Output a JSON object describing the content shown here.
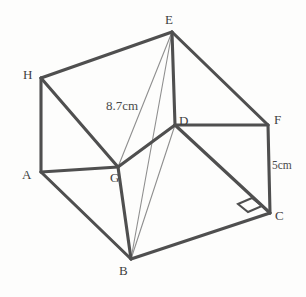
{
  "figure": {
    "type": "geometry-diagram",
    "shape": "cuboid",
    "background_color": "#fdfdfc",
    "edge_color": "#4f4f4f",
    "diagonal_color": "#8a8a8a",
    "label_color": "#3f3f3f",
    "width": 306,
    "height": 297
  },
  "vertices": [
    {
      "id": "E",
      "label": "E",
      "x": 172,
      "y": 32,
      "label_x": 165,
      "label_y": 13
    },
    {
      "id": "H",
      "label": "H",
      "x": 41,
      "y": 78,
      "label_x": 23,
      "label_y": 68
    },
    {
      "id": "F",
      "label": "F",
      "x": 268,
      "y": 125,
      "label_x": 274,
      "label_y": 113
    },
    {
      "id": "D",
      "label": "D",
      "x": 175,
      "y": 125,
      "label_x": 179,
      "label_y": 114
    },
    {
      "id": "A",
      "label": "A",
      "x": 41,
      "y": 172,
      "label_x": 22,
      "label_y": 168
    },
    {
      "id": "G",
      "label": "G",
      "x": 118,
      "y": 167,
      "label_x": 110,
      "label_y": 171
    },
    {
      "id": "C",
      "label": "C",
      "x": 270,
      "y": 213,
      "label_x": 275,
      "label_y": 209
    },
    {
      "id": "B",
      "label": "B",
      "x": 131,
      "y": 259,
      "label_x": 119,
      "label_y": 264
    }
  ],
  "edges": [
    {
      "from": "H",
      "to": "E",
      "style": "solid-bold"
    },
    {
      "from": "E",
      "to": "F",
      "style": "solid-bold"
    },
    {
      "from": "H",
      "to": "A",
      "style": "solid-bold"
    },
    {
      "from": "H",
      "to": "G",
      "style": "solid-bold"
    },
    {
      "from": "A",
      "to": "G",
      "style": "solid-bold"
    },
    {
      "from": "A",
      "to": "B",
      "style": "solid-bold"
    },
    {
      "from": "G",
      "to": "D",
      "style": "solid-bold"
    },
    {
      "from": "G",
      "to": "B",
      "style": "solid-bold"
    },
    {
      "from": "E",
      "to": "D",
      "style": "solid-bold"
    },
    {
      "from": "D",
      "to": "F",
      "style": "solid-bold"
    },
    {
      "from": "D",
      "to": "C",
      "style": "solid-bold"
    },
    {
      "from": "F",
      "to": "C",
      "style": "solid-bold"
    },
    {
      "from": "B",
      "to": "C",
      "style": "solid-bold"
    }
  ],
  "diagonals": [
    {
      "from": "E",
      "to": "B",
      "style": "thin"
    },
    {
      "from": "D",
      "to": "B",
      "style": "thin"
    },
    {
      "from": "E",
      "to": "G",
      "style": "thin"
    }
  ],
  "measurements": [
    {
      "id": "slant-length",
      "text": "8.7cm",
      "x": 106,
      "y": 99,
      "size": "normal"
    },
    {
      "id": "height",
      "text": "5cm",
      "x": 272,
      "y": 160,
      "size": "small"
    }
  ],
  "markers": [
    {
      "id": "right-angle-at-c",
      "type": "right-angle-square",
      "points": "238,204 252,198 262,206 248,212"
    }
  ]
}
